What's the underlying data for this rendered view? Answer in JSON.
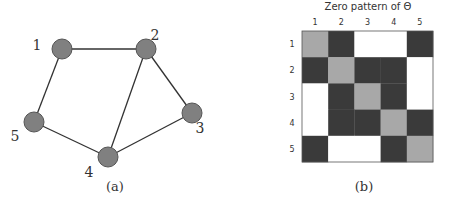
{
  "panel_a": {
    "caption": "(a)",
    "nodes": [
      {
        "id": "1",
        "label": "1",
        "x": 62,
        "y": 49,
        "lx": 37,
        "ly": 50
      },
      {
        "id": "2",
        "label": "2",
        "x": 146,
        "y": 49,
        "lx": 155,
        "ly": 40
      },
      {
        "id": "3",
        "label": "3",
        "x": 192,
        "y": 113,
        "lx": 200,
        "ly": 133
      },
      {
        "id": "4",
        "label": "4",
        "x": 108,
        "y": 157,
        "lx": 89,
        "ly": 177
      },
      {
        "id": "5",
        "label": "5",
        "x": 34,
        "y": 122,
        "lx": 15,
        "ly": 141
      }
    ],
    "edges": [
      [
        "1",
        "2"
      ],
      [
        "1",
        "5"
      ],
      [
        "2",
        "3"
      ],
      [
        "2",
        "4"
      ],
      [
        "3",
        "4"
      ],
      [
        "4",
        "5"
      ]
    ],
    "colors": {
      "node_fill": "#808080",
      "node_stroke": "#555555",
      "edge": "#333333"
    }
  },
  "panel_b": {
    "title": "Zero pattern of Θ",
    "caption": "(b)",
    "col_labels": [
      "1",
      "2",
      "3",
      "4",
      "5"
    ],
    "row_labels": [
      "1",
      "2",
      "3",
      "4",
      "5"
    ],
    "matrix": [
      [
        "d",
        "n",
        "z",
        "z",
        "n"
      ],
      [
        "n",
        "d",
        "n",
        "n",
        "z"
      ],
      [
        "z",
        "n",
        "d",
        "n",
        "z"
      ],
      [
        "z",
        "n",
        "n",
        "d",
        "n"
      ],
      [
        "n",
        "z",
        "z",
        "n",
        "d"
      ]
    ],
    "legend_colors": {
      "d": "#a8a8a8",
      "n": "#3a3a3a",
      "z": "#ffffff"
    },
    "grid": {
      "x": 302,
      "y": 31,
      "cell": 26.2
    }
  }
}
